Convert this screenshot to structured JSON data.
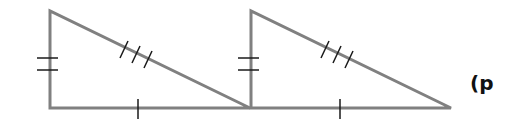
{
  "diagram": {
    "colors": {
      "edge": "#808080",
      "tick": "#1a1a1a",
      "background": "#ffffff"
    },
    "triangles": [
      {
        "name": "triangle-1",
        "vertices": [
          [
            50,
            11
          ],
          [
            50,
            108
          ],
          [
            250,
            108
          ]
        ],
        "marks": {
          "vertical_leg": 2,
          "hypotenuse": 3,
          "base": 1
        }
      },
      {
        "name": "triangle-2",
        "vertices": [
          [
            251,
            11
          ],
          [
            251,
            108
          ],
          [
            451,
            108
          ]
        ],
        "marks": {
          "vertical_leg": 2,
          "hypotenuse": 3,
          "base": 1
        }
      }
    ],
    "label": "(p"
  }
}
